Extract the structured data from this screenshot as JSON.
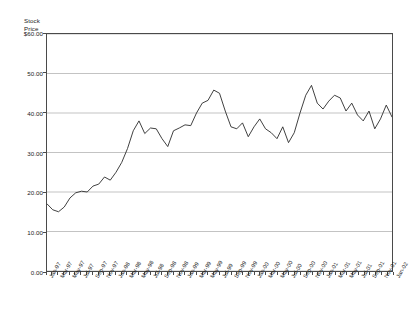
{
  "top_fragment": "",
  "chart_data": {
    "type": "line",
    "title": "",
    "xlabel": "",
    "ylabel": "Stock Price",
    "ylabel_lines": [
      "Stock",
      "Price"
    ],
    "ylim": [
      0,
      60
    ],
    "yticks": [
      60,
      50,
      40,
      30,
      20,
      10,
      0
    ],
    "ytick_labels": [
      "$60.00",
      "50.00",
      "40.00",
      "30.00",
      "20.00",
      "10.00",
      "0.00"
    ],
    "grid": true,
    "grid_axis": "y",
    "legend": "none",
    "line_color": "#2b2b2b",
    "plot_border_color": "#4a4a4a",
    "grid_color": "#a9a9a9",
    "x": [
      "Jan-97",
      "Feb-97",
      "Mar-97",
      "Apr-97",
      "May-97",
      "Jun-97",
      "Jul-97",
      "Aug-97",
      "Sep-97",
      "Oct-97",
      "Nov-97",
      "Dec-97",
      "Jan-98",
      "Feb-98",
      "Mar-98",
      "Apr-98",
      "May-98",
      "Jun-98",
      "Jul-98",
      "Aug-98",
      "Sep-98",
      "Oct-98",
      "Nov-98",
      "Dec-98",
      "Jan-99",
      "Feb-99",
      "Mar-99",
      "Apr-99",
      "May-99",
      "Jun-99",
      "Jul-99",
      "Aug-99",
      "Sep-99",
      "Oct-99",
      "Nov-99",
      "Dec-99",
      "Jan-00",
      "Feb-00",
      "Mar-00",
      "Apr-00",
      "May-00",
      "Jun-00",
      "Jul-00",
      "Aug-00",
      "Sep-00",
      "Oct-00",
      "Nov-00",
      "Dec-00",
      "Jan-01",
      "Feb-01",
      "Mar-01",
      "Apr-01",
      "May-01",
      "Jun-01",
      "Jul-01",
      "Aug-01",
      "Sep-01",
      "Oct-01",
      "Nov-01",
      "Dec-01",
      "Jan-02"
    ],
    "xtick_labels": [
      "Jan-97",
      "Mar-97",
      "May-97",
      "Jul-97",
      "Sep-97",
      "Nov-97",
      "Jan-98",
      "Mar-98",
      "May-98",
      "Jul-98",
      "Sep-98",
      "Nov-98",
      "Jan-99",
      "Mar-99",
      "May-99",
      "Jul-99",
      "Sep-99",
      "Nov-99",
      "Jan-00",
      "Mar-00",
      "May-00",
      "Jul-00",
      "Sep-00",
      "Nov-00",
      "Jan-01",
      "Mar-01",
      "May-01",
      "Jul-01",
      "Sep-01",
      "Nov-01",
      "Jan-02"
    ],
    "xtick_indices": [
      0,
      2,
      4,
      6,
      8,
      10,
      12,
      14,
      16,
      18,
      20,
      22,
      24,
      26,
      28,
      30,
      32,
      34,
      36,
      38,
      40,
      42,
      44,
      46,
      48,
      50,
      52,
      54,
      56,
      58,
      60
    ],
    "values": [
      17.0,
      15.5,
      15.0,
      16.2,
      18.5,
      19.8,
      20.2,
      20.0,
      21.5,
      22.0,
      23.8,
      23.0,
      25.0,
      27.5,
      31.0,
      35.5,
      38.0,
      34.8,
      36.2,
      36.0,
      33.5,
      31.5,
      35.5,
      36.2,
      37.0,
      36.8,
      40.0,
      42.5,
      43.2,
      45.8,
      45.0,
      40.5,
      36.5,
      36.0,
      37.5,
      34.0,
      36.5,
      38.5,
      36.0,
      35.0,
      33.5,
      36.5,
      32.5,
      35.0,
      40.0,
      44.5,
      47.0,
      42.5,
      41.0,
      43.0,
      44.5,
      43.8,
      40.5,
      42.5,
      39.5,
      38.0,
      40.5,
      36.0,
      38.5,
      42.0,
      39.0
    ]
  }
}
